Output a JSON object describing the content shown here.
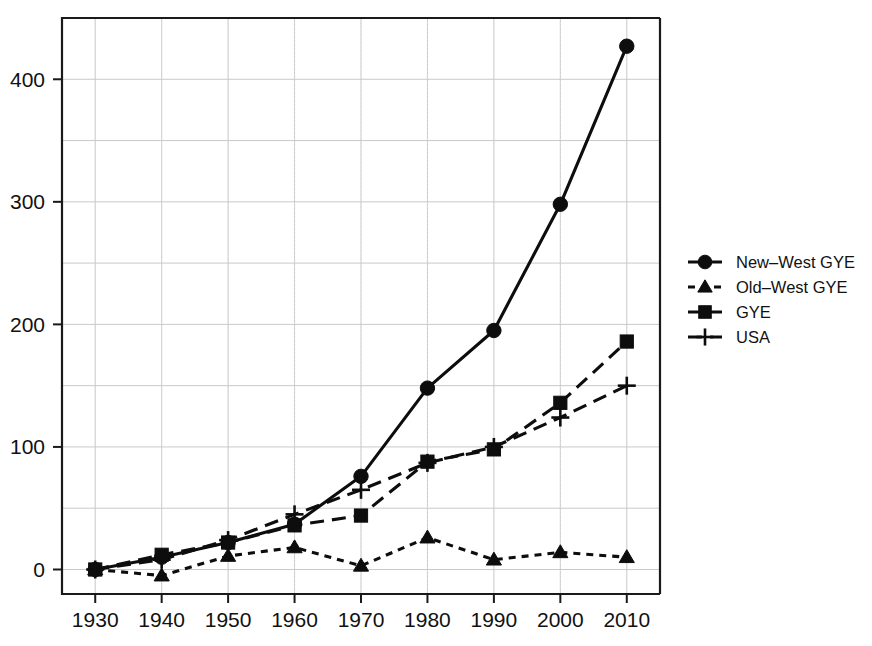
{
  "chart_data": {
    "type": "line",
    "title": "",
    "subtitle": "",
    "xlabel": "",
    "ylabel": "",
    "x": [
      1930,
      1940,
      1950,
      1960,
      1970,
      1980,
      1990,
      2000,
      2010
    ],
    "categories": [
      "1930",
      "1940",
      "1950",
      "1960",
      "1970",
      "1980",
      "1990",
      "2000",
      "2010"
    ],
    "xlim": [
      1925,
      2015
    ],
    "ylim": [
      -20,
      450
    ],
    "xticks": [
      "1930",
      "1940",
      "1950",
      "1960",
      "1970",
      "1980",
      "1990",
      "2000",
      "2010"
    ],
    "yticks": [
      "0",
      "100",
      "200",
      "300",
      "400"
    ],
    "ytick_values": [
      0,
      100,
      200,
      300,
      400
    ],
    "y_minor_values": [
      50,
      150,
      250,
      350
    ],
    "grid": true,
    "grid_style": "dotted-light",
    "legend_position": "right",
    "series": [
      {
        "name": "New–West GYE",
        "marker": "circle",
        "linestyle": "solid",
        "color": "#0d0d0d",
        "values": [
          0,
          10,
          22,
          37,
          76,
          148,
          195,
          298,
          427
        ]
      },
      {
        "name": "Old–West GYE",
        "marker": "triangle",
        "linestyle": "dotted",
        "color": "#0d0d0d",
        "values": [
          0,
          -5,
          11,
          18,
          3,
          26,
          8,
          14,
          10
        ]
      },
      {
        "name": "GYE",
        "marker": "square",
        "linestyle": "dashed",
        "color": "#0d0d0d",
        "values": [
          0,
          12,
          22,
          36,
          44,
          88,
          98,
          136,
          186
        ]
      },
      {
        "name": "USA",
        "marker": "plus",
        "linestyle": "dashed",
        "color": "#0d0d0d",
        "values": [
          0,
          8,
          24,
          45,
          65,
          87,
          100,
          124,
          150
        ]
      }
    ]
  },
  "legend": {
    "entries": [
      {
        "label": "New–West GYE",
        "marker": "circle",
        "linestyle": "solid"
      },
      {
        "label": "Old–West GYE",
        "marker": "triangle",
        "linestyle": "dotted"
      },
      {
        "label": "GYE",
        "marker": "square",
        "linestyle": "dashed"
      },
      {
        "label": "USA",
        "marker": "plus",
        "linestyle": "dashed"
      }
    ]
  },
  "plot_area": {
    "x0": 62,
    "y0": 18,
    "x1": 660,
    "y1": 594
  },
  "colors": {
    "ink": "#0d0d0d",
    "frame": "#1a1a1a",
    "grid_major": "#c9c9c9",
    "grid_minor": "#dcdcdc",
    "background": "#ffffff"
  }
}
